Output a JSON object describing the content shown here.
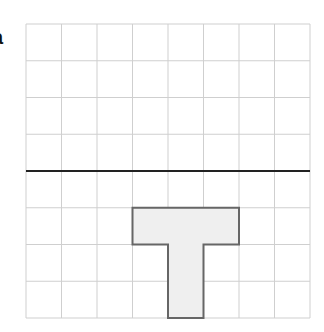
{
  "figure": {
    "label": "a",
    "grid": {
      "columns": 8,
      "rows": 8,
      "origin_x": 26,
      "origin_y": 24,
      "cell_width": 35.5,
      "cell_height": 36.75,
      "line_color": "#cfcfcf",
      "border_color": "#c8c8c8"
    },
    "mirror_line": {
      "row_index": 4,
      "color": "#222222",
      "width": 2
    },
    "shape": {
      "name": "T",
      "fill": "#efefef",
      "stroke": "#666666",
      "cells": [
        [
          3,
          5
        ],
        [
          4,
          5
        ],
        [
          5,
          5
        ],
        [
          4,
          6
        ],
        [
          4,
          7
        ]
      ]
    }
  }
}
